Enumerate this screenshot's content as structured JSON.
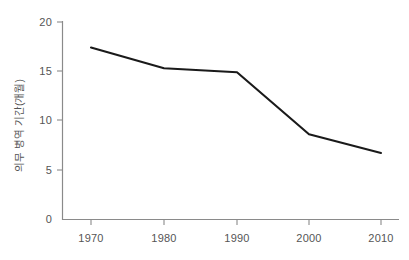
{
  "chart_data": {
    "type": "line",
    "title": "",
    "subtitle": "",
    "xlabel": "",
    "ylabel": "의무 병역 기간(개월)",
    "x": [
      1970,
      1980,
      1990,
      2000,
      2010
    ],
    "categories": [
      "1970",
      "1980",
      "1990",
      "2000",
      "2010"
    ],
    "values": [
      17.4,
      15.3,
      14.9,
      8.6,
      6.7
    ],
    "series": [
      {
        "name": "의무 병역 기간(개월)",
        "values": [
          17.4,
          15.3,
          14.9,
          8.6,
          6.7
        ]
      }
    ],
    "xlim": [
      1965,
      2013
    ],
    "ylim": [
      0,
      20
    ],
    "yticks": [
      0,
      5,
      10,
      15,
      20
    ],
    "ytick_labels": [
      "0",
      "5",
      "10",
      "15",
      "20"
    ],
    "xticks": [
      1970,
      1980,
      1990,
      2000,
      2010
    ],
    "xtick_labels": [
      "1970",
      "1980",
      "1990",
      "2000",
      "2010"
    ],
    "grid": false,
    "legend": false,
    "legend_position": "none",
    "annotations": [],
    "colors": {
      "line": "#1a1a1a",
      "axis": "#8a8a8a",
      "tick_text": "#555555",
      "background": "#ffffff"
    }
  },
  "axes": {
    "y": {
      "label": "의무 병역 기간(개월)",
      "ticks": [
        {
          "value": "20",
          "y": 22
        },
        {
          "value": "15",
          "y": 71
        },
        {
          "value": "10",
          "y": 120
        },
        {
          "value": "5",
          "y": 170
        },
        {
          "value": "0",
          "y": 219
        }
      ]
    },
    "x": {
      "label": "",
      "ticks": [
        {
          "value": "1970",
          "x": 91
        },
        {
          "value": "1980",
          "x": 164
        },
        {
          "value": "1990",
          "x": 237
        },
        {
          "value": "2000",
          "x": 309
        },
        {
          "value": "2010",
          "x": 381
        }
      ]
    }
  }
}
